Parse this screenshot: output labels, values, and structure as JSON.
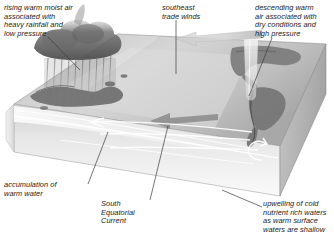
{
  "figure": {
    "canvas": {
      "width": 334,
      "height": 241
    },
    "background_color": "#ffffff"
  },
  "annotations": {
    "rising_air": {
      "text": "rising warm moist air\nassociated with\nheavy rainfall and\nlow pressure",
      "lines": [
        "rising warm moist air",
        "associated with",
        "heavy rainfall and",
        "low pressure"
      ],
      "position": "top-left"
    },
    "trade_winds": {
      "text": "southeast\ntrade winds",
      "lines": [
        "southeast",
        "trade winds"
      ],
      "position": "top-center"
    },
    "descending_air": {
      "text": "descending warm\nair associated with\ndry conditions and\nhigh pressure",
      "lines": [
        "descending warm",
        "air associated with",
        "dry conditions and",
        "high pressure"
      ],
      "position": "top-right"
    },
    "warm_pool": {
      "text": "accumulation of\nwarm water",
      "lines": [
        "accumulation of",
        "warm water"
      ],
      "position": "bottom-left"
    },
    "south_equatorial_current": {
      "text": "South\nEquatorial\nCurrent",
      "lines": [
        "South",
        "Equatorial",
        "Current"
      ],
      "position": "bottom-center"
    },
    "upwelling": {
      "text": "upwelling of cold\nnutrient rich waters\nas warm surface\nwaters are shallow",
      "lines": [
        "upwelling of cold",
        "nutrient rich waters",
        "as warm surface",
        "waters are shallow"
      ],
      "position": "bottom-right"
    }
  },
  "diagram_elements": {
    "block": {
      "description": "isometric 3-D block of the tropical Pacific ocean basin",
      "top_face_color": "#c9c9c9",
      "front_face_color": "#ebebeb",
      "right_face_color": "#bdbdbd",
      "edge_color": "#9a9a9a"
    },
    "landmasses": [
      {
        "name": "australasia-maritime-continent",
        "side": "west",
        "color": "#6e6e6e"
      },
      {
        "name": "the-americas",
        "side": "east",
        "color": "#7a7a7a"
      }
    ],
    "convection": {
      "name": "storm-cloud-column",
      "side": "west",
      "color": "#777777",
      "description": "dark cumulonimbus cloud mass with heavy rainfall"
    },
    "subsidence": {
      "name": "descending-air-column",
      "side": "east",
      "color": "#e4e4e4",
      "description": "pale column of sinking dry air"
    },
    "arrows": [
      {
        "name": "trade-wind-arrow-upper",
        "direction": "west",
        "color": "#d2d2d2"
      },
      {
        "name": "trade-wind-arrow-surface",
        "direction": "west",
        "color": "#8c8c8c"
      },
      {
        "name": "equatorial-current-arrow",
        "direction": "west",
        "color": "#ffffff"
      },
      {
        "name": "upwelling-curl-arrow",
        "direction": "up",
        "color": "#ffffff"
      },
      {
        "name": "thermocline-flow-arrow",
        "direction": "east",
        "color": "#ffffff"
      }
    ],
    "leader_lines_color": "#4a4a4a"
  }
}
